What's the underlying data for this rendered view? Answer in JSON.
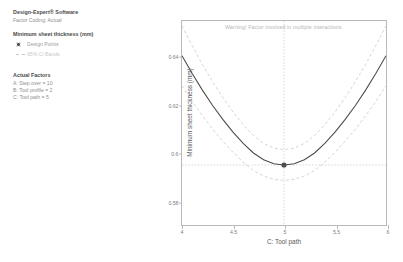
{
  "legend": {
    "brand": "Design-Expert® Software",
    "coding": "Factor Coding: Actual",
    "response": "Minimum sheet thickness (mm)",
    "items": [
      {
        "label": "Design Points",
        "marker": "filled-circle",
        "color": "#4d4d4d"
      },
      {
        "label": "95% CI Bands",
        "marker": "dashed-line",
        "color": "#c9c9c9"
      }
    ],
    "factors_heading": "Actual Factors",
    "factors": [
      "A: Step over = 10",
      "B: Tool profile = 2",
      "C: Tool path = 5"
    ]
  },
  "chart_data": {
    "type": "line",
    "title": "",
    "annotation": "Warning! Factor involved in multiple interactions.",
    "xlabel": "C: Tool path",
    "ylabel": "Minimum sheet thickness (mm)",
    "xlim": [
      4,
      6
    ],
    "ylim": [
      0.57,
      0.655
    ],
    "xticks": [
      4,
      4.5,
      5,
      5.5,
      6
    ],
    "xticklabels": [
      "4",
      "4.5",
      "5",
      "5.5",
      "6"
    ],
    "yticks": [
      0.64,
      0.62,
      0.6,
      0.58
    ],
    "yticklabels": [
      "0.64",
      "0.62",
      "0.6",
      "0.58"
    ],
    "grid": false,
    "legend_position": "outside-left",
    "x": [
      4,
      4.1,
      4.2,
      4.3,
      4.4,
      4.5,
      4.6,
      4.7,
      4.8,
      4.9,
      5,
      5.1,
      5.2,
      5.3,
      5.4,
      5.5,
      5.6,
      5.7,
      5.8,
      5.9,
      6
    ],
    "series": [
      {
        "name": "Predicted mean",
        "style": "solid",
        "color": "#4a4a4a",
        "values": [
          0.6405,
          0.6331,
          0.6262,
          0.6198,
          0.614,
          0.6087,
          0.604,
          0.6,
          0.5972,
          0.5955,
          0.595,
          0.5955,
          0.5972,
          0.6,
          0.604,
          0.6087,
          0.614,
          0.6198,
          0.6262,
          0.6331,
          0.6405
        ]
      },
      {
        "name": "95% CI upper band",
        "style": "dashed",
        "color": "#c9c9c9",
        "values": [
          0.653,
          0.6447,
          0.6369,
          0.6297,
          0.6231,
          0.6171,
          0.6118,
          0.6073,
          0.604,
          0.602,
          0.6014,
          0.602,
          0.604,
          0.6073,
          0.6118,
          0.6171,
          0.6231,
          0.6297,
          0.6369,
          0.6447,
          0.653
        ]
      },
      {
        "name": "95% CI lower band",
        "style": "dashed",
        "color": "#c9c9c9",
        "values": [
          0.628,
          0.6215,
          0.6155,
          0.6099,
          0.6049,
          0.6003,
          0.5962,
          0.5927,
          0.5904,
          0.589,
          0.5886,
          0.589,
          0.5904,
          0.5927,
          0.5962,
          0.6003,
          0.6049,
          0.6099,
          0.6155,
          0.6215,
          0.628
        ]
      }
    ],
    "points": [
      {
        "label": "design-point",
        "x": 5,
        "y": 0.595,
        "color": "#4d4d4d"
      }
    ],
    "crosshair": {
      "x": 5,
      "y": 0.595,
      "color": "#d8c0c0"
    }
  }
}
